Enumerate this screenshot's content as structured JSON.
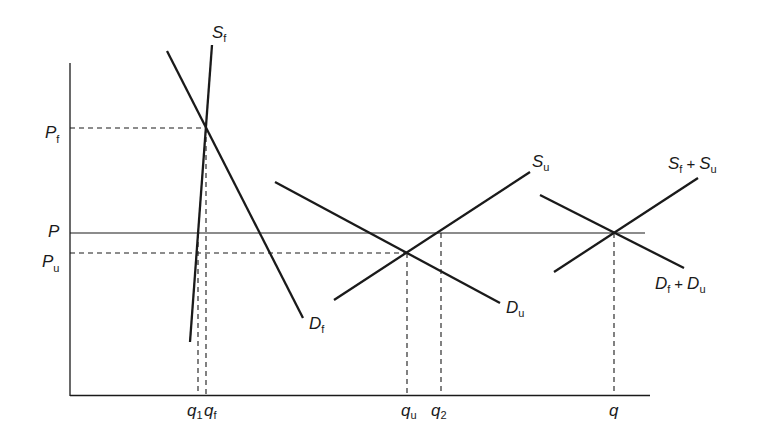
{
  "diagram": {
    "type": "economics supply-demand market aggregation",
    "axes": {
      "y_labels": {
        "Pf": {
          "main": "P",
          "sub": "f"
        },
        "P": {
          "main": "P",
          "sub": ""
        },
        "Pu": {
          "main": "P",
          "sub": "u"
        }
      },
      "x_labels": {
        "q1": {
          "main": "q",
          "sub": "1"
        },
        "qf": {
          "main": "q",
          "sub": "f"
        },
        "qu": {
          "main": "q",
          "sub": "u"
        },
        "q2": {
          "main": "q",
          "sub": "2"
        },
        "q": {
          "main": "q",
          "sub": ""
        }
      }
    },
    "curves": {
      "Sf": {
        "main": "S",
        "sub": "f"
      },
      "Df": {
        "main": "D",
        "sub": "f"
      },
      "Su": {
        "main": "S",
        "sub": "u"
      },
      "Du": {
        "main": "D",
        "sub": "u"
      },
      "SfSu": {
        "a_main": "S",
        "a_sub": "f",
        "op": "+",
        "b_main": "S",
        "b_sub": "u"
      },
      "DfDu": {
        "a_main": "D",
        "a_sub": "f",
        "op": "+",
        "b_main": "D",
        "b_sub": "u"
      }
    },
    "colors": {
      "line": "#1a1a1a",
      "background": "#ffffff"
    }
  }
}
